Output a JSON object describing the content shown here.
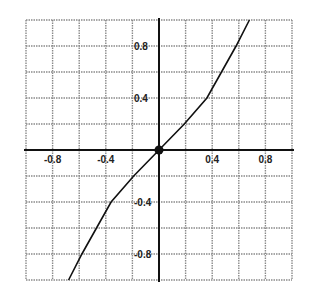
{
  "chart_data": {
    "type": "line",
    "title": "",
    "xlabel": "",
    "ylabel": "",
    "xlim": [
      -1.0,
      1.0
    ],
    "ylim": [
      -1.0,
      1.0
    ],
    "grid": true,
    "grid_step": 0.2,
    "x_tick_labels": [
      "-0.8",
      "-0.4",
      "0.4",
      "0.8"
    ],
    "y_tick_labels": [
      "0.8",
      "0.4",
      "-0.4",
      "-0.8"
    ],
    "series": [
      {
        "name": "curve",
        "points": [
          [
            -0.68,
            -1.0
          ],
          [
            -0.58,
            -0.8
          ],
          [
            -0.47,
            -0.6
          ],
          [
            -0.36,
            -0.4
          ],
          [
            -0.19,
            -0.2
          ],
          [
            0.0,
            0.0
          ],
          [
            0.19,
            0.2
          ],
          [
            0.36,
            0.4
          ],
          [
            0.47,
            0.6
          ],
          [
            0.58,
            0.8
          ],
          [
            0.68,
            1.0
          ]
        ]
      }
    ],
    "marked_point": {
      "x": 0.0,
      "y": 0.0,
      "label": "origin"
    }
  }
}
